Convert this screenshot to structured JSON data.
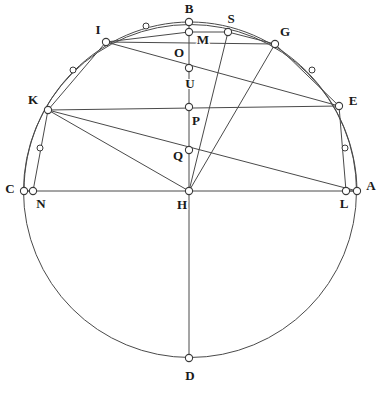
{
  "figure": {
    "type": "geometry-diagram",
    "canvas": {
      "width": 384,
      "height": 399
    },
    "stroke_color": "#4a4a4a",
    "label_color": "#1a1a1a",
    "node_fill": "#ffffff",
    "center": {
      "name": "H",
      "x": 190,
      "y": 191
    },
    "radius": 167
  },
  "labels": {
    "A": "A",
    "B": "B",
    "C": "C",
    "D": "D",
    "E": "E",
    "G": "G",
    "H": "H",
    "I": "I",
    "K": "K",
    "L": "L",
    "M": "M",
    "N": "N",
    "O": "O",
    "P": "P",
    "Q": "Q",
    "S": "S",
    "U": "U"
  },
  "points": [
    {
      "id": "B",
      "label": "B",
      "x": 189,
      "y": 22,
      "lx": 189,
      "ly": 10,
      "size": "large"
    },
    {
      "id": "M",
      "label": "M",
      "x": 189,
      "y": 32,
      "lx": 202,
      "ly": 41,
      "size": "large"
    },
    {
      "id": "S",
      "label": "S",
      "x": 228,
      "y": 32,
      "lx": 230,
      "ly": 20,
      "size": "large"
    },
    {
      "id": "I",
      "label": "I",
      "x": 106,
      "y": 42,
      "lx": 98,
      "ly": 31,
      "size": "large"
    },
    {
      "id": "G",
      "label": "G",
      "x": 275,
      "y": 44,
      "lx": 284,
      "ly": 33,
      "size": "large"
    },
    {
      "id": "O",
      "label": "O",
      "x": 189,
      "y": 68,
      "lx": 180,
      "ly": 54,
      "size": "large"
    },
    {
      "id": "U",
      "label": "U",
      "x": 189,
      "y": 88,
      "lx": 189,
      "ly": 85,
      "size": "text-only"
    },
    {
      "id": "K",
      "label": "K",
      "x": 48,
      "y": 110,
      "lx": 33,
      "ly": 101,
      "size": "large"
    },
    {
      "id": "E",
      "label": "E",
      "x": 339,
      "y": 106,
      "lx": 352,
      "ly": 101,
      "size": "large"
    },
    {
      "id": "P",
      "label": "P",
      "x": 189,
      "y": 107,
      "lx": 196,
      "ly": 121,
      "size": "large"
    },
    {
      "id": "Q",
      "label": "Q",
      "x": 189,
      "y": 150,
      "lx": 178,
      "ly": 157,
      "size": "large"
    },
    {
      "id": "C",
      "label": "C",
      "x": 24,
      "y": 191,
      "lx": 11,
      "ly": 189,
      "size": "large"
    },
    {
      "id": "N",
      "label": "N",
      "x": 33,
      "y": 191,
      "lx": 40,
      "ly": 205,
      "size": "large"
    },
    {
      "id": "H",
      "label": "H",
      "x": 189,
      "y": 191,
      "lx": 183,
      "ly": 205,
      "size": "large"
    },
    {
      "id": "L",
      "label": "L",
      "x": 346,
      "y": 191,
      "lx": 343,
      "ly": 205,
      "size": "large"
    },
    {
      "id": "A",
      "label": "A",
      "x": 357,
      "y": 191,
      "lx": 369,
      "ly": 187,
      "size": "large"
    },
    {
      "id": "D",
      "label": "D",
      "x": 189,
      "y": 358,
      "lx": 189,
      "ly": 375,
      "size": "large"
    }
  ],
  "arc_nodes": [
    {
      "id": "arc-K-N",
      "x": 40,
      "y": 148
    },
    {
      "id": "arc-K-I",
      "x": 73,
      "y": 70
    },
    {
      "id": "arc-I-B",
      "x": 146,
      "y": 26
    },
    {
      "id": "arc-G-E",
      "x": 312,
      "y": 70
    },
    {
      "id": "arc-E-L",
      "x": 345,
      "y": 148
    }
  ],
  "segments": [
    {
      "id": "axis-B-D",
      "from": "B",
      "to": "D",
      "kind": "axis"
    },
    {
      "id": "chord-C-A",
      "from": "C",
      "to": "A",
      "kind": "chord"
    },
    {
      "id": "chord-I-G",
      "from": "I",
      "to": "G",
      "kind": "chord"
    },
    {
      "id": "chord-K-E",
      "from": "K",
      "to": "E",
      "kind": "chord"
    },
    {
      "id": "chord-K-A",
      "from": "K",
      "to": "A",
      "kind": "chord"
    },
    {
      "id": "chord-I-E",
      "from": "I",
      "to": "E",
      "kind": "chord"
    },
    {
      "id": "ray-H-S",
      "from": "H",
      "to": "S",
      "kind": "ray"
    },
    {
      "id": "ray-H-G",
      "from": "H",
      "to": "G",
      "kind": "ray"
    },
    {
      "id": "ray-H-B",
      "from": "H",
      "to": "B",
      "kind": "ray"
    }
  ],
  "inscribed_polygon": {
    "id": "polyline-N-K-I-M-S-G-E-L",
    "vertices": [
      "N",
      "K",
      "I",
      "M",
      "S",
      "G",
      "E",
      "L"
    ]
  },
  "outer_arc": {
    "id": "arc-C-B-A",
    "from": "C",
    "apex": "B",
    "to": "A"
  }
}
